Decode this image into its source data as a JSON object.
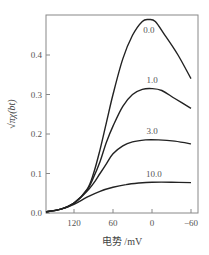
{
  "chart_data": {
    "type": "line",
    "title": "",
    "xlabel": "电势 /mV",
    "ylabel": "√πχ(bt)",
    "xlim": [
      163,
      -65
    ],
    "ylim": [
      0,
      0.5
    ],
    "x_reversed": true,
    "grid": false,
    "legend": "inline labels",
    "x_ticks": [
      120,
      60,
      0,
      -60
    ],
    "x_tick_labels": [
      "120",
      "60",
      "0",
      "-60"
    ],
    "y_ticks": [
      0.0,
      0.1,
      0.2,
      0.3,
      0.4
    ],
    "y_tick_labels": [
      "0.0",
      "0.1",
      "0.2",
      "0.3",
      "0.4"
    ],
    "series": [
      {
        "name": "0.0",
        "x": [
          163,
          140,
          120,
          100,
          90,
          80,
          70,
          60,
          45,
          30,
          15,
          5,
          -5,
          -20,
          -40,
          -60
        ],
        "values": [
          0.003,
          0.01,
          0.025,
          0.06,
          0.1,
          0.16,
          0.23,
          0.3,
          0.39,
          0.45,
          0.485,
          0.49,
          0.485,
          0.45,
          0.4,
          0.34
        ],
        "label_pos": [
          5,
          0.455
        ]
      },
      {
        "name": "1.0",
        "x": [
          163,
          140,
          120,
          100,
          90,
          80,
          70,
          60,
          45,
          30,
          15,
          0,
          -15,
          -35,
          -60
        ],
        "values": [
          0.003,
          0.01,
          0.025,
          0.058,
          0.09,
          0.13,
          0.18,
          0.22,
          0.27,
          0.3,
          0.313,
          0.315,
          0.31,
          0.29,
          0.265
        ],
        "label_pos": [
          0,
          0.33
        ]
      },
      {
        "name": "3.0",
        "x": [
          163,
          140,
          120,
          100,
          90,
          80,
          70,
          60,
          45,
          30,
          10,
          -10,
          -35,
          -60
        ],
        "values": [
          0.003,
          0.01,
          0.025,
          0.055,
          0.075,
          0.1,
          0.125,
          0.15,
          0.17,
          0.18,
          0.185,
          0.185,
          0.182,
          0.175
        ],
        "label_pos": [
          0,
          0.2
        ]
      },
      {
        "name": "10.0",
        "x": [
          163,
          140,
          120,
          100,
          80,
          60,
          40,
          20,
          0,
          -30,
          -60
        ],
        "values": [
          0.003,
          0.01,
          0.022,
          0.04,
          0.055,
          0.065,
          0.072,
          0.076,
          0.078,
          0.078,
          0.077
        ],
        "label_pos": [
          -3,
          0.09
        ]
      }
    ]
  },
  "layout": {
    "plot_left": 46,
    "plot_right": 198,
    "plot_top": 15,
    "plot_bottom": 213,
    "x_origin_px": 152,
    "px_per_mv": 0.65,
    "px_per_unit_y": 395,
    "line_color": "#222222",
    "frame_color": "#888888"
  }
}
